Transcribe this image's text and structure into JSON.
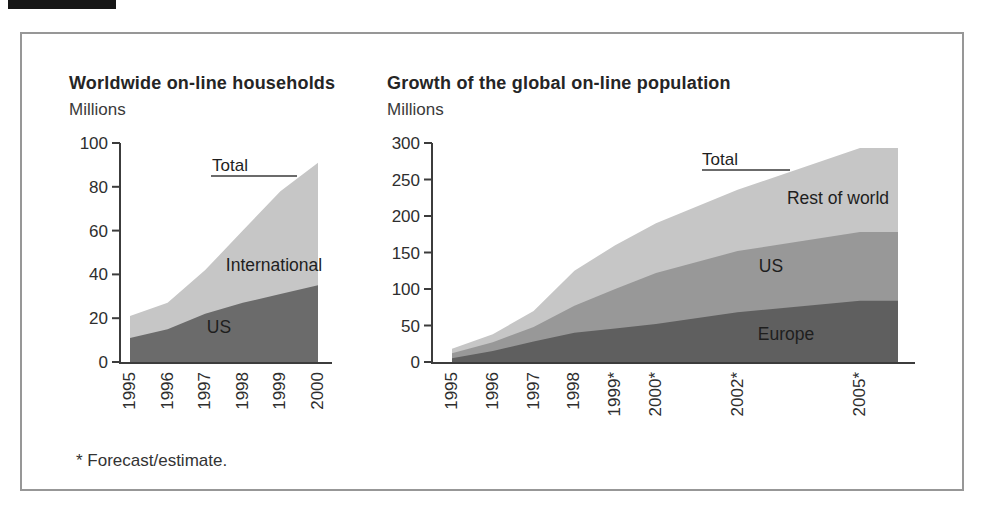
{
  "figure": {
    "footnote": "* Forecast/estimate."
  },
  "chart_data": [
    {
      "type": "area",
      "stacked": true,
      "title": "Worldwide on-line households",
      "ylabel": "Millions",
      "x": [
        1995,
        1996,
        1997,
        1998,
        1999,
        2000
      ],
      "x_tick_labels": [
        "1995",
        "1996",
        "1997",
        "1998",
        "1999",
        "2000"
      ],
      "ylim": [
        0,
        100
      ],
      "yticks": [
        0,
        20,
        40,
        60,
        80,
        100
      ],
      "total_label": "Total",
      "totals": [
        21,
        27,
        42,
        60,
        78,
        91
      ],
      "series": [
        {
          "name": "US",
          "values": [
            11,
            15,
            22,
            27,
            31,
            35
          ],
          "color": "#6b6b6b"
        },
        {
          "name": "International",
          "values": [
            10,
            12,
            20,
            33,
            47,
            56
          ],
          "color": "#c6c6c6"
        }
      ],
      "legend_position": "labels-on-areas",
      "grid": false
    },
    {
      "type": "area",
      "stacked": true,
      "title": "Growth of the global on-line population",
      "ylabel": "Millions",
      "x": [
        1995,
        1996,
        1997,
        1998,
        1999,
        2000,
        2002,
        2005
      ],
      "x_tick_labels": [
        "1995",
        "1996",
        "1997",
        "1998",
        "1999*",
        "2000*",
        "2002*",
        "2005*"
      ],
      "ylim": [
        0,
        300
      ],
      "yticks": [
        0,
        50,
        100,
        150,
        200,
        250,
        300
      ],
      "total_label": "Total",
      "totals": [
        18,
        38,
        70,
        125,
        160,
        190,
        236,
        293
      ],
      "series": [
        {
          "name": "Europe",
          "values": [
            5,
            15,
            28,
            40,
            46,
            52,
            68,
            84
          ],
          "color": "#5f5f5f"
        },
        {
          "name": "US",
          "values": [
            7,
            12,
            20,
            37,
            54,
            70,
            84,
            94
          ],
          "color": "#989898"
        },
        {
          "name": "Rest of world",
          "values": [
            6,
            11,
            22,
            48,
            60,
            68,
            84,
            115
          ],
          "color": "#c6c6c6"
        }
      ],
      "legend_position": "labels-on-areas",
      "grid": false
    }
  ]
}
